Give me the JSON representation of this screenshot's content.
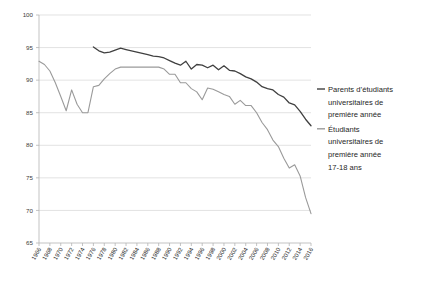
{
  "chart_data": {
    "type": "line",
    "title": "",
    "xlabel": "",
    "ylabel": "",
    "ylim": [
      65,
      100
    ],
    "yticks": [
      65,
      70,
      75,
      80,
      85,
      90,
      95,
      100
    ],
    "grid": true,
    "legend_position": "right",
    "x": [
      1966,
      1967,
      1968,
      1969,
      1970,
      1971,
      1972,
      1973,
      1974,
      1975,
      1976,
      1977,
      1978,
      1979,
      1980,
      1981,
      1982,
      1983,
      1984,
      1985,
      1986,
      1987,
      1988,
      1989,
      1990,
      1991,
      1992,
      1993,
      1994,
      1995,
      1996,
      1997,
      1998,
      1999,
      2000,
      2001,
      2002,
      2003,
      2004,
      2005,
      2006,
      2007,
      2008,
      2009,
      2010,
      2011,
      2012,
      2013,
      2014,
      2015,
      2016
    ],
    "xticks": [
      1966,
      1968,
      1970,
      1972,
      1974,
      1976,
      1978,
      1980,
      1982,
      1984,
      1986,
      1988,
      1990,
      1992,
      1994,
      1996,
      1998,
      2000,
      2002,
      2004,
      2006,
      2008,
      2010,
      2012,
      2014,
      2016
    ],
    "series": [
      {
        "name": "Parents d’étudiants universitaires de première année",
        "color": "#404040",
        "width": 1.3,
        "start_year": 1976,
        "values": [
          null,
          null,
          null,
          null,
          null,
          null,
          null,
          null,
          null,
          null,
          95.1,
          94.5,
          94.2,
          94.3,
          94.6,
          94.9,
          94.7,
          94.5,
          94.3,
          94.1,
          93.9,
          93.7,
          93.6,
          93.4,
          93.0,
          92.6,
          92.3,
          92.9,
          91.7,
          92.4,
          92.3,
          91.9,
          92.3,
          91.6,
          92.2,
          91.5,
          91.4,
          91.0,
          90.5,
          90.2,
          89.7,
          89.0,
          88.7,
          88.5,
          87.8,
          87.4,
          86.5,
          86.2,
          85.2,
          84.0,
          83.0
        ]
      },
      {
        "name": "Étudiants universitaires de première année 17-18 ans",
        "color": "#9a9a9a",
        "width": 1.1,
        "start_year": 1966,
        "values": [
          92.9,
          92.4,
          91.4,
          89.6,
          87.5,
          85.3,
          88.5,
          86.3,
          85.0,
          85.0,
          89.0,
          89.2,
          90.2,
          91.0,
          91.7,
          92.0,
          92.0,
          92.0,
          92.0,
          92.0,
          92.0,
          92.0,
          92.0,
          91.7,
          90.9,
          90.9,
          89.6,
          89.6,
          88.7,
          88.2,
          87.0,
          88.8,
          88.6,
          88.2,
          87.8,
          87.5,
          86.3,
          86.9,
          86.1,
          86.1,
          85.0,
          83.5,
          82.4,
          80.8,
          79.8,
          78.0,
          76.5,
          77.0,
          75.3,
          72.0,
          69.5
        ]
      }
    ]
  },
  "legend": {
    "items": [
      {
        "label_lines": [
          "Parents d’étudiants",
          "universitaires de",
          "première année"
        ],
        "color": "#404040"
      },
      {
        "label_lines": [
          "Étudiants",
          "universitaires de",
          "première année",
          "17-18 ans"
        ],
        "color": "#9a9a9a"
      }
    ]
  }
}
